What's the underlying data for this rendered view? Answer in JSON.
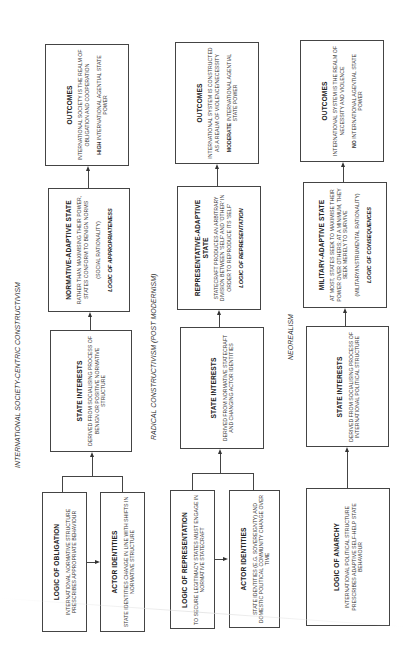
{
  "diagram": {
    "columns": [
      {
        "id": "isc",
        "title": "INTERNATIONAL SOCIETY-CENTRIC CONSTRUCTIVISM",
        "outcomes": {
          "title": "OUTCOMES",
          "desc": "INTERNATIONAL SOCIETY IS THE REALM OF OBLIGATION AND COOPERATION",
          "power_bold": "HIGH",
          "power_rest": " INTERNATIONAL AGENTIAL STATE POWER"
        },
        "state": {
          "title": "NORMATIVE-ADAPTIVE STATE",
          "desc": "RATHER THAN MAXIMISING THEIR POWER, STATES CONFORM TO BENIGN NORMS",
          "rationality": "(SOCIAL RATIONALITY)",
          "logic": "LOGIC OF APPROPRIATENESS"
        },
        "interests": {
          "title": "STATE INTERESTS",
          "desc": "DERIVED FROM SOCIALISING PROCESS OF BENIGN OR POSITIVE NORMATIVE STRUCTURE"
        },
        "logic_box": {
          "title": "LOGIC OF OBLIGATION",
          "desc": "INTERNATIONAL NORMATIVE STRUCTURE PRESCRIBES APPROPRIATE BEHAVIOUR"
        },
        "identities": {
          "title": "ACTOR IDENTITIES",
          "desc": "STATE IDENTITIES CHANGE IN LINE WITH SHIFTS IN NORMATIVE STRUCTURE"
        }
      },
      {
        "id": "rc",
        "title": "RADICAL CONSTRUCTIVISM (POST MODERNISM)",
        "outcomes": {
          "title": "OUTCOMES",
          "desc": "INTERNATIONAL SYSTEM IS CONSTRUCTED AS A REALM OF VIOLENCE/NECESSITY",
          "power_bold": "MODERATE",
          "power_rest": " INTERNATIONAL AGENTIAL STATE POWER"
        },
        "state": {
          "title": "REPRESENTATIVE-ADAPTIVE STATE",
          "desc": "STATECRAFT PRODUCES AN ARBITRARY DIVISION BETWEEN 'SELF' AND 'OTHER' IN ORDER TO REPRODUCE ITS 'SELF'",
          "rationality": "",
          "logic": "LOGIC OF REPRESENTATION"
        },
        "interests": {
          "title": "STATE INTERESTS",
          "desc": "DERIVED FROM NORMATIVE STATECRAFT AND CHANGING ACTOR IDENTITIES"
        },
        "logic_box": {
          "title": "LOGIC OF REPRESENTATION",
          "desc": "TO SECURE LEGITIMACY STATES MUST ENGAGE IN NORMATIVE STATECRAFT"
        },
        "identities": {
          "title": "ACTOR IDENTITIES",
          "desc": "STATE IDENTITIES (E.G. SOVEREIGNTY) AND DOMESTIC POLITICAL COMMUNITY CHANGE OVER TIME"
        }
      },
      {
        "id": "nr",
        "title": "NEOREALISM",
        "outcomes": {
          "title": "OUTCOMES",
          "desc": "INTERNATIONAL SYSTEM IS THE REALM OF NECESSITY AND VIOLENCE",
          "power_bold": "NO",
          "power_rest": " INTERNATIONAL AGENTIAL STATE POWER"
        },
        "state": {
          "title": "MILITARY-ADAPTIVE STATE",
          "desc": "AT MOST, STATES SEEK TO MAXIMISE THEIR POWER OVER OTHERS; AT A MINIMUM, THEY SEEK MERELY TO SURVIVE",
          "rationality": "(MILITARY/INSTRUMENTAL RATIONALITY)",
          "logic": "LOGIC OF CONSEQUENCES"
        },
        "interests": {
          "title": "STATE INTERESTS",
          "desc": "DERIVED FROM SOCIALISING PROCESS OF INTERNATIONAL POLITICAL STRUCTURE"
        },
        "logic_box": {
          "title": "LOGIC OF ANARCHY",
          "desc": "INTERNATIONAL POLITICAL STRUCTURE PRESCRIBES ADAPTIVE SELF-HELP STATE BEHAVIOUR"
        }
      }
    ]
  }
}
